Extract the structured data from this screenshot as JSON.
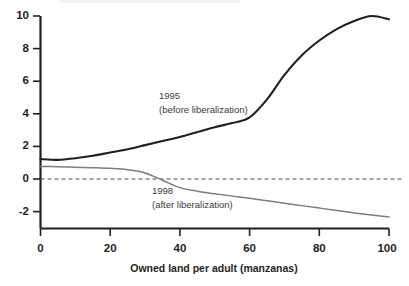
{
  "chart_data": {
    "type": "line",
    "title": "",
    "xlabel": "Owned land per adult (manzanas)",
    "ylabel": "",
    "xlim": [
      0,
      100
    ],
    "ylim": [
      -3,
      10
    ],
    "xticks": [
      0,
      20,
      40,
      60,
      80,
      100
    ],
    "yticks": [
      -2,
      0,
      2,
      4,
      6,
      8,
      10
    ],
    "xticklabels": [
      "0",
      "20",
      "40",
      "60",
      "80",
      "100"
    ],
    "yticklabels": [
      "-2",
      "0",
      "2",
      "4",
      "6",
      "8",
      "10"
    ],
    "grid": false,
    "legend_position": "inline-annotations",
    "zero_reference_line": 0,
    "series": [
      {
        "name": "1995",
        "annotation_line1": "1995",
        "annotation_line2": "(before liberalization)",
        "color": "#231f20",
        "x": [
          0,
          5,
          10,
          15,
          20,
          25,
          30,
          35,
          40,
          45,
          50,
          55,
          60,
          65,
          70,
          75,
          80,
          85,
          90,
          95,
          100
        ],
        "values": [
          1.25,
          1.2,
          1.3,
          1.45,
          1.65,
          1.85,
          2.1,
          2.35,
          2.6,
          2.9,
          3.2,
          3.45,
          3.8,
          4.9,
          6.4,
          7.6,
          8.5,
          9.2,
          9.7,
          10.0,
          9.8
        ]
      },
      {
        "name": "1998",
        "annotation_line1": "1998",
        "annotation_line2": "(after liberalization)",
        "color": "#7d7d7d",
        "x": [
          0,
          5,
          10,
          15,
          20,
          25,
          30,
          35,
          40,
          45,
          50,
          55,
          60,
          65,
          70,
          75,
          80,
          85,
          90,
          95,
          100
        ],
        "values": [
          0.8,
          0.78,
          0.75,
          0.72,
          0.68,
          0.6,
          0.4,
          -0.05,
          -0.5,
          -0.72,
          -0.88,
          -1.02,
          -1.15,
          -1.3,
          -1.45,
          -1.6,
          -1.75,
          -1.9,
          -2.05,
          -2.18,
          -2.3
        ]
      }
    ]
  },
  "annotations": {
    "a1995_line1": "1995",
    "a1995_line2": "(before liberalization)",
    "a1998_line1": "1998",
    "a1998_line2": "(after liberalization)"
  }
}
